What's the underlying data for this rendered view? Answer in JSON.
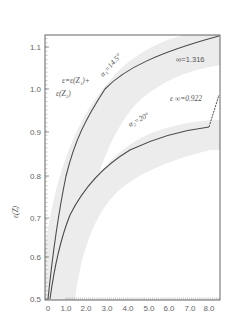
{
  "chart_data": {
    "type": "line",
    "title": "",
    "xlabel": "",
    "ylabel": "ε(Z)",
    "xlim": [
      0,
      8.5
    ],
    "ylim": [
      0.5,
      1.128
    ],
    "x_ticks": [
      "0",
      "1.0",
      "2.0",
      "3.0",
      "4.0",
      "5.0",
      "6.0",
      "7.0",
      "8.0"
    ],
    "y_ticks": [
      "0.5",
      "0.6",
      "0.7",
      "0.8",
      "0.9",
      "1.0",
      "1.1"
    ],
    "grid": false,
    "series": [
      {
        "name": "α = 14.5°",
        "x": [
          0,
          0.5,
          1.0,
          2.0,
          3.0,
          4.0,
          5.0,
          6.0,
          7.0,
          8.0,
          8.5
        ],
        "y": [
          0.5,
          0.7,
          0.8,
          0.93,
          1.0,
          1.04,
          1.07,
          1.09,
          1.105,
          1.12,
          1.128
        ],
        "asymptote": "∞=1.316"
      },
      {
        "name": "α = 20°",
        "x": [
          0,
          0.5,
          1.0,
          2.0,
          3.0,
          4.0,
          5.0,
          6.0,
          7.0,
          8.0,
          8.5
        ],
        "y": [
          0.5,
          0.63,
          0.7,
          0.78,
          0.82,
          0.85,
          0.87,
          0.885,
          0.895,
          0.905,
          1.05
        ],
        "asymptote": "ε∞=0.922"
      }
    ],
    "annotations": [
      "ε=ε(Z₁)+",
      "ε(Z₂)",
      "α₁=14.5°",
      "∞=1.316",
      "ε∞=0.922",
      "α₂=20°"
    ]
  },
  "labels": {
    "ylabel": "ε(Z)",
    "formula_line1": "ε=ε(Z₁)+",
    "formula_line2": "ε(Z₂)",
    "alpha1": "α₁=14.5°",
    "alpha2": "α₂=20°",
    "inf1": "∞=1.316",
    "inf2": "ε ∞=0.922"
  },
  "colors": {
    "curve": "#4a4a4a",
    "band": "#ececec",
    "axis": "#555555"
  }
}
